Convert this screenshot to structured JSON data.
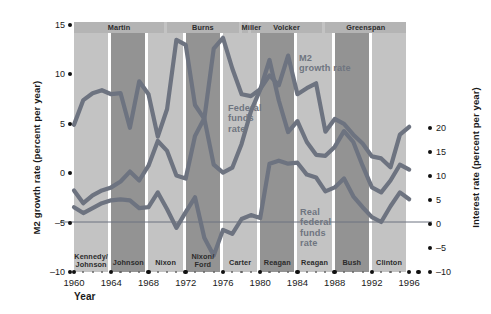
{
  "chart_data": {
    "type": "line",
    "title": "",
    "xlabel": "Year",
    "ylabel_left": "M2 growth rate (percent per year)",
    "ylabel_right": "Interest rate (percent per year)",
    "xlim": [
      1960,
      1997
    ],
    "ylim_left": [
      -10,
      15
    ],
    "ylim_right": [
      -10,
      20
    ],
    "grid": false,
    "legend_position": "inline-annotations",
    "xticks": [
      1960,
      1964,
      1968,
      1972,
      1976,
      1980,
      1984,
      1988,
      1992,
      1996
    ],
    "yticks_left": [
      15,
      10,
      5,
      0,
      -5,
      -10
    ],
    "yticks_right": [
      20,
      15,
      10,
      5,
      0,
      -5,
      -10
    ],
    "series": [
      {
        "name": "M2 growth rate",
        "axis": "left",
        "color": "#6d7380",
        "x": [
          1960,
          1961,
          1962,
          1963,
          1964,
          1965,
          1966,
          1967,
          1968,
          1969,
          1970,
          1971,
          1972,
          1973,
          1974,
          1975,
          1976,
          1977,
          1978,
          1979,
          1980,
          1981,
          1982,
          1983,
          1984,
          1985,
          1986,
          1987,
          1988,
          1989,
          1990,
          1991,
          1992,
          1993,
          1994,
          1995,
          1996
        ],
        "values": [
          4.9,
          7.4,
          8.1,
          8.4,
          8.0,
          8.1,
          4.6,
          9.3,
          8.0,
          3.7,
          6.5,
          13.5,
          13.0,
          6.9,
          5.5,
          12.6,
          13.7,
          10.6,
          8.0,
          7.8,
          8.5,
          9.9,
          8.9,
          11.9,
          8.0,
          8.6,
          9.1,
          4.2,
          5.5,
          5.0,
          3.9,
          3.0,
          1.7,
          1.5,
          0.6,
          3.9,
          4.7
        ]
      },
      {
        "name": "Federal funds rate",
        "axis": "right",
        "color": "#6d7380",
        "x": [
          1960,
          1961,
          1962,
          1963,
          1964,
          1965,
          1966,
          1967,
          1968,
          1969,
          1970,
          1971,
          1972,
          1973,
          1974,
          1975,
          1976,
          1977,
          1978,
          1979,
          1980,
          1981,
          1982,
          1983,
          1984,
          1985,
          1986,
          1987,
          1988,
          1989,
          1990,
          1991,
          1992,
          1993,
          1994,
          1995,
          1996
        ],
        "values": [
          3.2,
          1.9,
          2.7,
          3.2,
          3.5,
          4.1,
          5.1,
          4.2,
          5.7,
          8.2,
          7.2,
          4.7,
          4.4,
          8.7,
          10.5,
          5.8,
          5.0,
          5.5,
          7.9,
          11.2,
          13.4,
          16.4,
          12.3,
          9.1,
          10.2,
          8.1,
          6.8,
          6.7,
          7.6,
          9.2,
          8.1,
          5.7,
          3.5,
          3.0,
          4.2,
          5.8,
          5.3
        ]
      },
      {
        "name": "Real federal funds rate",
        "axis": "right",
        "color": "#6d7380",
        "x": [
          1960,
          1961,
          1962,
          1963,
          1964,
          1965,
          1966,
          1967,
          1968,
          1969,
          1970,
          1971,
          1972,
          1973,
          1974,
          1975,
          1976,
          1977,
          1978,
          1979,
          1980,
          1981,
          1982,
          1983,
          1984,
          1985,
          1986,
          1987,
          1988,
          1989,
          1990,
          1991,
          1992,
          1993,
          1994,
          1995,
          1996
        ],
        "values": [
          1.5,
          0.9,
          1.4,
          1.9,
          2.2,
          2.3,
          2.2,
          1.4,
          1.5,
          3.0,
          1.3,
          -0.6,
          1.0,
          2.5,
          -1.6,
          -3.4,
          -0.8,
          -1.2,
          0.3,
          0.7,
          0.4,
          5.9,
          6.2,
          5.9,
          6.0,
          4.8,
          4.5,
          3.1,
          3.5,
          4.4,
          2.6,
          1.5,
          0.5,
          0.0,
          1.6,
          3.0,
          2.3
        ]
      }
    ],
    "annotations": [
      {
        "name": "m2-growth-rate-label",
        "text": "M2\ngrowth rate",
        "x": 1985,
        "y": 11.5
      },
      {
        "name": "federal-funds-rate-label",
        "text": "Federal\nfunds\nrate",
        "x": 1977,
        "y": 5.0
      },
      {
        "name": "real-federal-funds-rate-label",
        "text": "Real\nfederal\nfunds\nrate",
        "x": 1987,
        "y": -4.2
      }
    ],
    "zero_line": {
      "value": 0,
      "axis": "right",
      "color": "#6d7380"
    },
    "bands": {
      "chairmen": [
        {
          "label": "Martin",
          "start": 1960,
          "end": 1970
        },
        {
          "label": "Burns",
          "start": 1970,
          "end": 1978
        },
        {
          "label": "Miller",
          "start": 1978,
          "end": 1979
        },
        {
          "label": "Volcker",
          "start": 1979,
          "end": 1987
        },
        {
          "label": "Greenspan",
          "start": 1987,
          "end": 1996
        }
      ],
      "presidents": [
        {
          "label": "Kennedy/\nJohnson",
          "start": 1960,
          "end": 1964,
          "shade": "light"
        },
        {
          "label": "Johnson",
          "start": 1964,
          "end": 1968,
          "shade": "dark"
        },
        {
          "label": "Nixon",
          "start": 1968,
          "end": 1972,
          "shade": "light"
        },
        {
          "label": "Nixon/\nFord",
          "start": 1972,
          "end": 1976,
          "shade": "dark"
        },
        {
          "label": "Carter",
          "start": 1976,
          "end": 1980,
          "shade": "light"
        },
        {
          "label": "Reagan",
          "start": 1980,
          "end": 1984,
          "shade": "dark"
        },
        {
          "label": "Reagan",
          "start": 1984,
          "end": 1988,
          "shade": "light"
        },
        {
          "label": "Bush",
          "start": 1988,
          "end": 1992,
          "shade": "dark"
        },
        {
          "label": "Clinton",
          "start": 1992,
          "end": 1996,
          "shade": "light"
        }
      ]
    },
    "colors": {
      "band_light": "#c3c3c3",
      "band_dark": "#939393",
      "line": "#6d7380",
      "text": "#1a1a1a",
      "annotation_text": "#6f7580",
      "background": "#ffffff"
    }
  },
  "axes": {
    "left": {
      "title": "M2 growth rate (percent per year)",
      "ticks": [
        "15",
        "10",
        "5",
        "0",
        "-5",
        "-10"
      ]
    },
    "right": {
      "title": "Interest rate (percent per year)",
      "ticks": [
        "20",
        "15",
        "10",
        "5",
        "0",
        "-5",
        "-10"
      ]
    },
    "bottom": {
      "title": "Year",
      "ticks": [
        "1960",
        "1964",
        "1968",
        "1972",
        "1976",
        "1980",
        "1984",
        "1988",
        "1992",
        "1996"
      ]
    }
  },
  "chairmen": [
    {
      "label": "Martin"
    },
    {
      "label": "Burns"
    },
    {
      "label": "Miller"
    },
    {
      "label": "Volcker"
    },
    {
      "label": "Greenspan"
    }
  ],
  "presidents": [
    {
      "line1": "Kennedy/",
      "line2": "Johnson"
    },
    {
      "line1": "Johnson",
      "line2": ""
    },
    {
      "line1": "Nixon",
      "line2": ""
    },
    {
      "line1": "Nixon/",
      "line2": "Ford"
    },
    {
      "line1": "Carter",
      "line2": ""
    },
    {
      "line1": "Reagan",
      "line2": ""
    },
    {
      "line1": "Reagan",
      "line2": ""
    },
    {
      "line1": "Bush",
      "line2": ""
    },
    {
      "line1": "Clinton",
      "line2": ""
    }
  ],
  "annotations": {
    "m2_line1": "M2",
    "m2_line2": "growth rate",
    "ff_line1": "Federal",
    "ff_line2": "funds",
    "ff_line3": "rate",
    "rff_line1": "Real",
    "rff_line2": "federal",
    "rff_line3": "funds",
    "rff_line4": "rate"
  }
}
